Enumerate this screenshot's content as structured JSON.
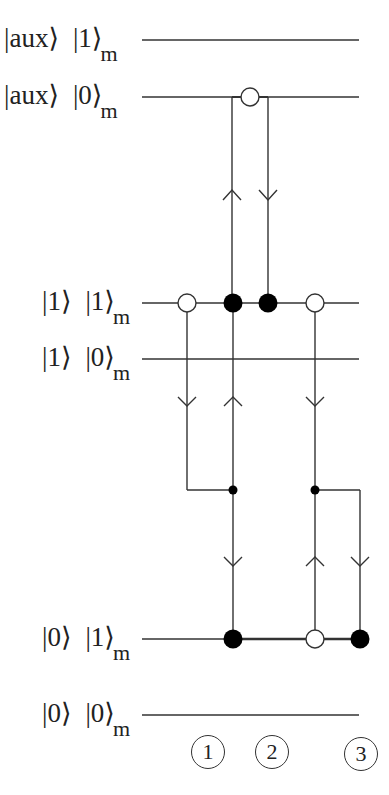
{
  "diagram": {
    "type": "energy-level transition diagram",
    "levels": [
      {
        "id": "aux-1m",
        "left": "|aux⟩",
        "right": "|1⟩",
        "sub": "m",
        "y": 40
      },
      {
        "id": "aux-0m",
        "left": "|aux⟩",
        "right": "|0⟩",
        "sub": "m",
        "y": 97
      },
      {
        "id": "1-1m",
        "left": "|1⟩",
        "right": "|1⟩",
        "sub": "m",
        "y": 303
      },
      {
        "id": "1-0m",
        "left": "|1⟩",
        "right": "|0⟩",
        "sub": "m",
        "y": 359
      },
      {
        "id": "0-1m",
        "left": "|0⟩",
        "right": "|1⟩",
        "sub": "m",
        "y": 639
      },
      {
        "id": "0-0m",
        "left": "|0⟩",
        "right": "|0⟩",
        "sub": "m",
        "y": 715
      }
    ],
    "steps": [
      {
        "label": "1",
        "x": 208
      },
      {
        "label": "2",
        "x": 272
      },
      {
        "label": "3",
        "x": 361
      }
    ],
    "colors": {
      "line": "#333333",
      "filled_dot": "#000000",
      "open_dot": "#ffffff",
      "text": "#222222"
    }
  }
}
